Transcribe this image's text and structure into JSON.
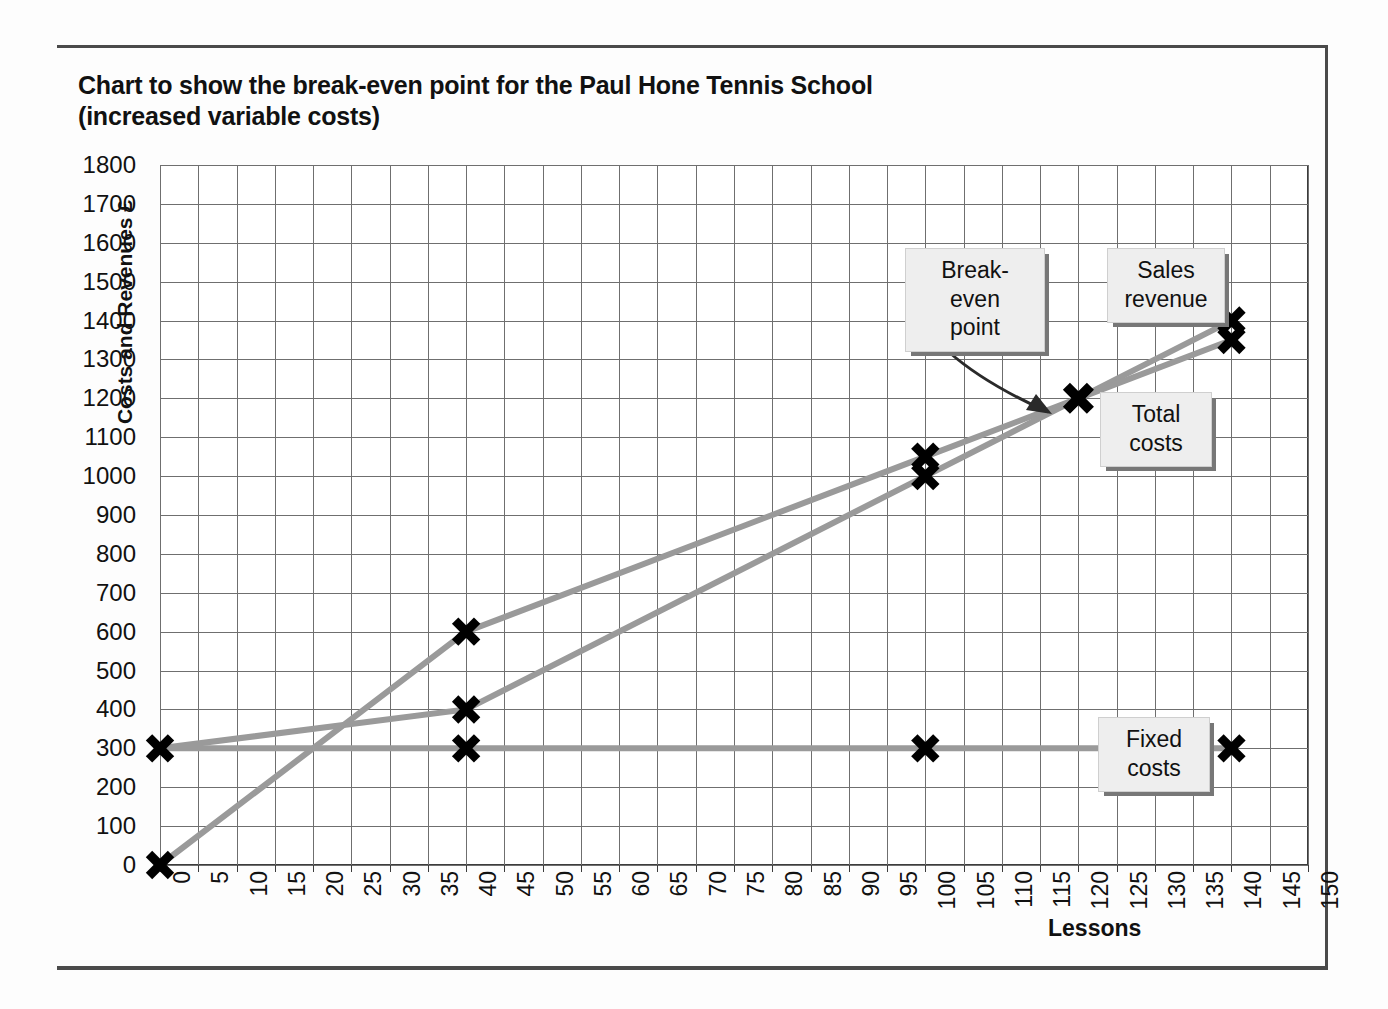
{
  "title": {
    "line1": "Chart to show the break-even point for the Paul Hone Tennis School",
    "line2": "(increased variable costs)"
  },
  "callouts": {
    "breakeven": {
      "line1": "Break-even",
      "line2": "point"
    },
    "sales": {
      "line1": "Sales",
      "line2": "revenue"
    },
    "total": {
      "line1": "Total",
      "line2": "costs"
    },
    "fixed": {
      "line1": "Fixed",
      "line2": "costs"
    }
  },
  "colors": {
    "line": "#9a9a9a",
    "marker": "#000000",
    "grid": "#6f6f6f",
    "frame": "#3c3c3c",
    "callout_bg": "#eeeeee",
    "callout_shadow": "#777777"
  },
  "chart_data": {
    "type": "line",
    "title": "Chart to show the break-even point for the Paul Hone Tennis School (increased variable costs)",
    "xlabel": "Lessons",
    "ylabel": "Costs and Revenues £",
    "xlim": [
      0,
      150
    ],
    "ylim": [
      0,
      1800
    ],
    "xticks": [
      0,
      5,
      10,
      15,
      20,
      25,
      30,
      35,
      40,
      45,
      50,
      55,
      60,
      65,
      70,
      75,
      80,
      85,
      90,
      95,
      100,
      105,
      110,
      115,
      120,
      125,
      130,
      135,
      140,
      145,
      150
    ],
    "yticks": [
      0,
      100,
      200,
      300,
      400,
      500,
      600,
      700,
      800,
      900,
      1000,
      1100,
      1200,
      1300,
      1400,
      1500,
      1600,
      1700,
      1800
    ],
    "grid": true,
    "legend": "callout-labels",
    "series": [
      {
        "name": "Sales revenue",
        "x": [
          0,
          40,
          100,
          120,
          140
        ],
        "values": [
          0,
          600,
          1050,
          1200,
          1400
        ],
        "markers_x": [
          0,
          40,
          100,
          120,
          140
        ],
        "markers_y": [
          0,
          600,
          1050,
          1200,
          1400
        ]
      },
      {
        "name": "Total costs",
        "x": [
          0,
          40,
          100,
          120,
          140
        ],
        "values": [
          300,
          400,
          1000,
          1200,
          1350
        ],
        "markers_x": [
          40,
          100,
          140
        ],
        "markers_y": [
          400,
          1000,
          1350
        ]
      },
      {
        "name": "Fixed costs",
        "x": [
          0,
          40,
          100,
          140
        ],
        "values": [
          300,
          300,
          300,
          300
        ],
        "markers_x": [
          0,
          40,
          100,
          140
        ],
        "markers_y": [
          300,
          300,
          300,
          300
        ]
      }
    ],
    "annotations": [
      {
        "label": "Break-even point",
        "x": 120,
        "y": 1200
      }
    ]
  }
}
